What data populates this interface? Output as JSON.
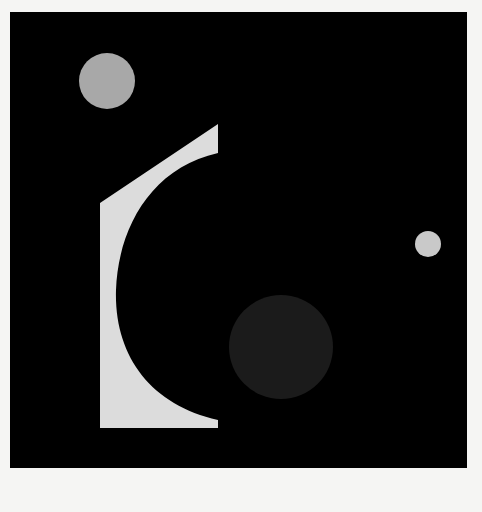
{
  "artwork": {
    "background_color": "#f5f5f3",
    "canvas": {
      "x": 10,
      "y": 12,
      "width": 457,
      "height": 456,
      "color": "#000000"
    },
    "shapes": {
      "grey_circle": {
        "cx": 107,
        "cy": 81,
        "r": 28,
        "color": "#a8a8a8"
      },
      "small_circle": {
        "cx": 428,
        "cy": 244,
        "r": 13,
        "color": "#c9c9c9"
      },
      "dark_circle": {
        "cx": 281,
        "cy": 347,
        "r": 52,
        "color": "#1b1b1b"
      },
      "light_form": {
        "color": "#dcdcdc",
        "path": "M100 203 L218 124 L218 153 C150 168 118 230 116 290 C114 355 150 405 218 420 L218 428 L100 428 Z"
      }
    }
  }
}
